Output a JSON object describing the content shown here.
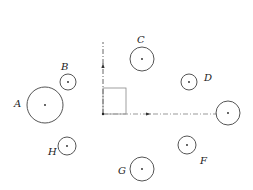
{
  "diagram": {
    "width": 253,
    "height": 190,
    "background": "#ffffff",
    "stroke_color": "#555555",
    "origin": {
      "x": 103,
      "y": 114
    },
    "vertical_axis": {
      "x": 103,
      "y_top": 42,
      "y_bottom": 114,
      "arrow_y": 64
    },
    "horizontal_axis": {
      "y": 114,
      "x_left": 103,
      "x_right": 217,
      "arrow_x": 150
    },
    "rectangle": {
      "x": 103,
      "y": 88,
      "width": 23,
      "height": 26
    },
    "circles": [
      {
        "id": "A",
        "label": "A",
        "cx": 45,
        "cy": 105,
        "r": 18,
        "label_x": 14,
        "label_y": 107
      },
      {
        "id": "B",
        "label": "B",
        "cx": 68,
        "cy": 82,
        "r": 8,
        "label_x": 61,
        "label_y": 70
      },
      {
        "id": "C",
        "label": "C",
        "cx": 142,
        "cy": 59,
        "r": 12,
        "label_x": 137,
        "label_y": 43
      },
      {
        "id": "D",
        "label": "D",
        "cx": 189,
        "cy": 82,
        "r": 8,
        "label_x": 204,
        "label_y": 81
      },
      {
        "id": "E",
        "label": "",
        "cx": 228,
        "cy": 113,
        "r": 12,
        "label_x": 0,
        "label_y": 0
      },
      {
        "id": "F",
        "label": "F",
        "cx": 187,
        "cy": 145,
        "r": 9,
        "label_x": 200,
        "label_y": 164
      },
      {
        "id": "G",
        "label": "G",
        "cx": 142,
        "cy": 169,
        "r": 12,
        "label_x": 118,
        "label_y": 174
      },
      {
        "id": "H",
        "label": "H",
        "cx": 67,
        "cy": 146,
        "r": 9,
        "label_x": 48,
        "label_y": 155
      }
    ]
  }
}
